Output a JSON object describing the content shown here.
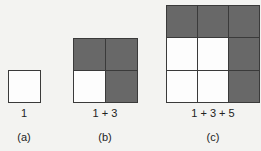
{
  "figure": {
    "panels": [
      {
        "id": "a",
        "caption": "(a)",
        "sum_label": "1",
        "size": 1,
        "cells": [
          "white"
        ]
      },
      {
        "id": "b",
        "caption": "(b)",
        "sum_label": "1 + 3",
        "size": 2,
        "cells": [
          "dark",
          "dark",
          "white",
          "dark"
        ]
      },
      {
        "id": "c",
        "caption": "(c)",
        "sum_label": "1 + 3 + 5",
        "size": 3,
        "cells": [
          "dark",
          "dark",
          "dark",
          "white",
          "white",
          "dark",
          "white",
          "white",
          "dark"
        ]
      }
    ],
    "colors": {
      "dark_cell": "#686868",
      "white_cell": "#fdfdfd",
      "border": "#3a3a3a",
      "background": "#f3f3f1"
    }
  }
}
